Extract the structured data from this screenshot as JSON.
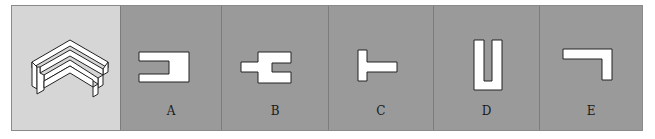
{
  "puzzle": {
    "question_figure": "isometric-l-shaped-3d-block",
    "options": [
      {
        "label": "A",
        "shape": "c-shape-open-right"
      },
      {
        "label": "B",
        "shape": "stepped-fork-shape"
      },
      {
        "label": "C",
        "shape": "t-shape-rotated"
      },
      {
        "label": "D",
        "shape": "u-shape"
      },
      {
        "label": "E",
        "shape": "l-shape-inverted"
      }
    ],
    "colors": {
      "question_bg": "#d6d6d6",
      "option_bg": "#9a9a9a",
      "shape_fill": "#ffffff",
      "outline": "#222222"
    }
  }
}
